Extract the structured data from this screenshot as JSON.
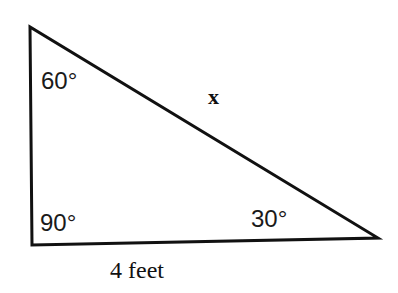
{
  "diagram": {
    "type": "right-triangle",
    "vertices": {
      "top": {
        "x": 30,
        "y": 27
      },
      "bottom_left": {
        "x": 32,
        "y": 245
      },
      "bottom_right": {
        "x": 378,
        "y": 238
      }
    },
    "angles": {
      "top": "60°",
      "bottom_left": "90°",
      "bottom_right": "30°"
    },
    "labels": {
      "hypotenuse": "x",
      "base": "4 feet"
    },
    "stroke_color": "#111111",
    "background": "#ffffff"
  }
}
